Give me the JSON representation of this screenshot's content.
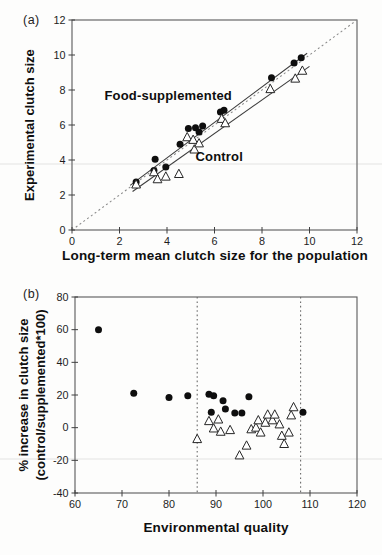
{
  "panels": [
    {
      "letter": "(a)",
      "xlabel": "Long-term mean clutch size for the population",
      "ylabel": "Experimental clutch size"
    },
    {
      "letter": "(b)",
      "xlabel": "Environmental quality",
      "ylabel_line1": "% increase in clutch size",
      "ylabel_line2": "(control/supplemented*100)"
    }
  ],
  "colors": {
    "marker_fill": "#0e0e0e",
    "triangle_stroke": "#262626",
    "frame": "#5a5a5a",
    "dashed_line": "#8a8a8a",
    "solid_line": "#3c3c3c"
  },
  "chart_data": [
    {
      "type": "scatter",
      "panel": "a",
      "xlabel": "Long-term mean clutch size for the population",
      "ylabel": "Experimental clutch size",
      "xlim": [
        0,
        12
      ],
      "ylim": [
        0,
        12
      ],
      "xticks": [
        0,
        2,
        4,
        6,
        8,
        10,
        12
      ],
      "yticks": [
        0,
        2,
        4,
        6,
        8,
        10,
        12
      ],
      "grid": false,
      "series": [
        {
          "name": "Food-supplemented",
          "marker": "filled-circle",
          "points": [
            [
              2.7,
              2.75
            ],
            [
              3.45,
              3.4
            ],
            [
              3.5,
              4.05
            ],
            [
              3.95,
              3.6
            ],
            [
              4.55,
              4.9
            ],
            [
              4.9,
              5.8
            ],
            [
              5.2,
              5.85
            ],
            [
              5.35,
              5.6
            ],
            [
              5.5,
              5.95
            ],
            [
              6.25,
              6.75
            ],
            [
              6.4,
              6.85
            ],
            [
              8.4,
              8.7
            ],
            [
              9.35,
              9.55
            ],
            [
              9.65,
              9.85
            ]
          ]
        },
        {
          "name": "Control",
          "marker": "open-triangle",
          "points": [
            [
              2.7,
              2.6
            ],
            [
              3.45,
              3.3
            ],
            [
              3.6,
              2.9
            ],
            [
              3.95,
              3.05
            ],
            [
              4.5,
              3.2
            ],
            [
              4.85,
              5.3
            ],
            [
              5.1,
              5.15
            ],
            [
              5.15,
              4.6
            ],
            [
              5.35,
              4.95
            ],
            [
              6.3,
              6.35
            ],
            [
              6.45,
              6.1
            ],
            [
              8.35,
              8.05
            ],
            [
              9.4,
              8.65
            ],
            [
              9.7,
              9.1
            ]
          ]
        }
      ],
      "lines": [
        {
          "name": "identity-line",
          "style": "dashed",
          "from": [
            0,
            0
          ],
          "to": [
            12,
            12
          ]
        },
        {
          "name": "supplemented-regression-line",
          "style": "solid",
          "from": [
            2.45,
            2.55
          ],
          "to": [
            9.9,
            10.1
          ]
        },
        {
          "name": "control-regression-line",
          "style": "solid",
          "from": [
            2.55,
            2.2
          ],
          "to": [
            10.0,
            9.35
          ]
        }
      ],
      "annotations": [
        {
          "text": "Food-supplemented",
          "x": 4.05,
          "y": 7.45
        },
        {
          "text": "Control",
          "x": 6.2,
          "y": 3.95
        }
      ]
    },
    {
      "type": "scatter",
      "panel": "b",
      "xlabel": "Environmental quality",
      "ylabel": "% increase in clutch size (control/supplemented*100)",
      "xlim": [
        60,
        120
      ],
      "ylim": [
        -40,
        80
      ],
      "xticks": [
        60,
        70,
        80,
        90,
        100,
        110,
        120
      ],
      "yticks": [
        -40,
        -20,
        0,
        20,
        40,
        60,
        80
      ],
      "grid": false,
      "series": [
        {
          "name": "Food-supplemented",
          "marker": "filled-circle",
          "points": [
            [
              65,
              60
            ],
            [
              72.5,
              21
            ],
            [
              80,
              18.5
            ],
            [
              84,
              19.5
            ],
            [
              88.5,
              20.5
            ],
            [
              89.5,
              19.5
            ],
            [
              89,
              9.5
            ],
            [
              91.5,
              16.5
            ],
            [
              92,
              11.5
            ],
            [
              94,
              9
            ],
            [
              95.5,
              9
            ],
            [
              97,
              19
            ],
            [
              108.5,
              9.5
            ]
          ]
        },
        {
          "name": "Control",
          "marker": "open-triangle",
          "points": [
            [
              86,
              -7
            ],
            [
              88.5,
              4
            ],
            [
              89.5,
              -0.5
            ],
            [
              90.5,
              5
            ],
            [
              91,
              -2.5
            ],
            [
              93,
              -1.5
            ],
            [
              95,
              -17
            ],
            [
              96.5,
              -11
            ],
            [
              97.5,
              -1
            ],
            [
              98.5,
              0
            ],
            [
              99,
              4.5
            ],
            [
              99.5,
              -3
            ],
            [
              100.5,
              3
            ],
            [
              101,
              8
            ],
            [
              102,
              4.5
            ],
            [
              102.5,
              8
            ],
            [
              103.5,
              2
            ],
            [
              104,
              -5
            ],
            [
              104.5,
              -10
            ],
            [
              105.5,
              -3
            ],
            [
              106,
              7.5
            ],
            [
              106.5,
              12.5
            ]
          ]
        }
      ],
      "vlines": [
        {
          "name": "lower-quality-threshold",
          "x": 86,
          "style": "dashed"
        },
        {
          "name": "upper-quality-threshold",
          "x": 108,
          "style": "dashed"
        }
      ],
      "lines": [],
      "annotations": []
    }
  ]
}
